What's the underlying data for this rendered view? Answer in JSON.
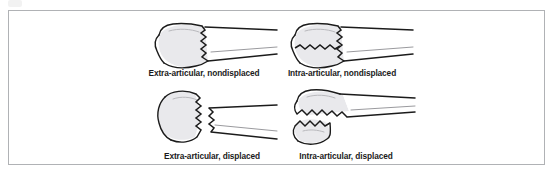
{
  "figure": {
    "border_color": "#b0b2b5",
    "background_color": "#ffffff",
    "ink_color": "#1b1b1b",
    "shading_color": "#c9c9cc",
    "panels": [
      {
        "id": "top-left",
        "caption": "Extra-articular, nondisplaced",
        "articular_involvement": "extra-articular",
        "displacement": "nondisplaced",
        "fracture_lines": 1,
        "fragments_separated": false
      },
      {
        "id": "top-right",
        "caption": "Intra-articular, nondisplaced",
        "articular_involvement": "intra-articular",
        "displacement": "nondisplaced",
        "fracture_lines": 2,
        "fragments_separated": false
      },
      {
        "id": "bottom-left",
        "caption": "Extra-articular, displaced",
        "articular_involvement": "extra-articular",
        "displacement": "displaced",
        "fracture_lines": 1,
        "fragments_separated": true
      },
      {
        "id": "bottom-right",
        "caption": "Intra-articular, displaced",
        "articular_involvement": "intra-articular",
        "displacement": "displaced",
        "fracture_lines": 2,
        "fragments_separated": true
      }
    ]
  }
}
